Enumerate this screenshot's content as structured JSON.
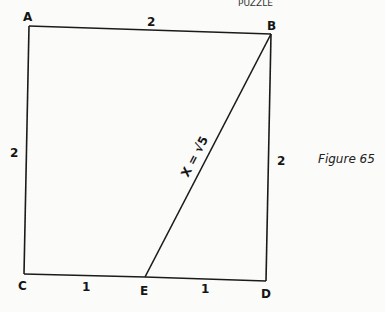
{
  "header_fragment": "PUZZLE",
  "figure": {
    "caption": "Figure 65",
    "vertices": {
      "A": "A",
      "B": "B",
      "C": "C",
      "D": "D",
      "E": "E"
    },
    "edge_labels": {
      "AB": "2",
      "AC": "2",
      "BD": "2",
      "CE": "1",
      "ED": "1",
      "BE": "X = √5"
    },
    "segments": [
      {
        "from": "A",
        "to": "B",
        "length": 2
      },
      {
        "from": "A",
        "to": "C",
        "length": 2
      },
      {
        "from": "B",
        "to": "D",
        "length": 2
      },
      {
        "from": "C",
        "to": "E",
        "length": 1
      },
      {
        "from": "E",
        "to": "D",
        "length": 1
      },
      {
        "from": "B",
        "to": "E",
        "length": "√5"
      }
    ]
  }
}
